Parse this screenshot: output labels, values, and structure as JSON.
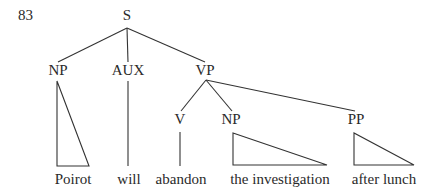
{
  "example_number": "83",
  "tree": {
    "root": "S",
    "nodes": {
      "s": "S",
      "np_subject": "NP",
      "aux": "AUX",
      "vp": "VP",
      "v": "V",
      "np_object": "NP",
      "pp": "PP"
    },
    "leaves": {
      "np_subject": "Poirot",
      "aux": "will",
      "v": "abandon",
      "np_object": "the investigation",
      "pp": "after lunch"
    }
  }
}
